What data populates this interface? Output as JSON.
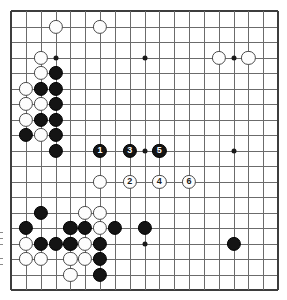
{
  "figure": {
    "kind": "go-game-diagram",
    "board_size": 19,
    "board_bounds": {
      "left": 11,
      "top": 11,
      "right": 278,
      "bottom": 290
    },
    "colors": {
      "black": "#141414",
      "white": "#fdfdfd",
      "line": "#6b6b6b",
      "edge": "#3d3d3d",
      "background": "#ffffff"
    }
  },
  "hoshi": [
    {
      "col": 3,
      "row": 3
    },
    {
      "col": 9,
      "row": 3
    },
    {
      "col": 15,
      "row": 3
    },
    {
      "col": 3,
      "row": 9
    },
    {
      "col": 9,
      "row": 9
    },
    {
      "col": 15,
      "row": 9
    },
    {
      "col": 3,
      "row": 15
    },
    {
      "col": 9,
      "row": 15
    },
    {
      "col": 15,
      "row": 15
    }
  ],
  "stones": [
    {
      "col": 3,
      "row": 1,
      "color": "white",
      "label": ""
    },
    {
      "col": 6,
      "row": 1,
      "color": "white",
      "label": ""
    },
    {
      "col": 14,
      "row": 3,
      "color": "white",
      "label": ""
    },
    {
      "col": 16,
      "row": 3,
      "color": "white",
      "label": ""
    },
    {
      "col": 2,
      "row": 3,
      "color": "white",
      "label": ""
    },
    {
      "col": 2,
      "row": 4,
      "color": "white",
      "label": ""
    },
    {
      "col": 3,
      "row": 4,
      "color": "black",
      "label": ""
    },
    {
      "col": 1,
      "row": 5,
      "color": "white",
      "label": ""
    },
    {
      "col": 2,
      "row": 5,
      "color": "black",
      "label": ""
    },
    {
      "col": 3,
      "row": 5,
      "color": "black",
      "label": ""
    },
    {
      "col": 1,
      "row": 6,
      "color": "white",
      "label": ""
    },
    {
      "col": 2,
      "row": 6,
      "color": "white",
      "label": ""
    },
    {
      "col": 3,
      "row": 6,
      "color": "black",
      "label": ""
    },
    {
      "col": 1,
      "row": 7,
      "color": "white",
      "label": ""
    },
    {
      "col": 2,
      "row": 7,
      "color": "black",
      "label": ""
    },
    {
      "col": 3,
      "row": 7,
      "color": "black",
      "label": ""
    },
    {
      "col": 1,
      "row": 8,
      "color": "black",
      "label": ""
    },
    {
      "col": 2,
      "row": 8,
      "color": "white",
      "label": ""
    },
    {
      "col": 3,
      "row": 8,
      "color": "black",
      "label": ""
    },
    {
      "col": 3,
      "row": 9,
      "color": "black",
      "label": ""
    },
    {
      "col": 6,
      "row": 9,
      "color": "black",
      "label": "1"
    },
    {
      "col": 8,
      "row": 9,
      "color": "black",
      "label": "3"
    },
    {
      "col": 10,
      "row": 9,
      "color": "black",
      "label": "5"
    },
    {
      "col": 6,
      "row": 11,
      "color": "white",
      "label": ""
    },
    {
      "col": 8,
      "row": 11,
      "color": "white",
      "label": "2"
    },
    {
      "col": 10,
      "row": 11,
      "color": "white",
      "label": "4"
    },
    {
      "col": 12,
      "row": 11,
      "color": "white",
      "label": "6"
    },
    {
      "col": 2,
      "row": 13,
      "color": "black",
      "label": ""
    },
    {
      "col": 5,
      "row": 13,
      "color": "white",
      "label": ""
    },
    {
      "col": 6,
      "row": 13,
      "color": "white",
      "label": ""
    },
    {
      "col": 1,
      "row": 14,
      "color": "black",
      "label": ""
    },
    {
      "col": 4,
      "row": 14,
      "color": "black",
      "label": ""
    },
    {
      "col": 5,
      "row": 14,
      "color": "black",
      "label": ""
    },
    {
      "col": 6,
      "row": 14,
      "color": "white",
      "label": ""
    },
    {
      "col": 7,
      "row": 14,
      "color": "black",
      "label": ""
    },
    {
      "col": 9,
      "row": 14,
      "color": "black",
      "label": ""
    },
    {
      "col": 1,
      "row": 15,
      "color": "white",
      "label": ""
    },
    {
      "col": 2,
      "row": 15,
      "color": "black",
      "label": ""
    },
    {
      "col": 3,
      "row": 15,
      "color": "black",
      "label": ""
    },
    {
      "col": 4,
      "row": 15,
      "color": "black",
      "label": ""
    },
    {
      "col": 5,
      "row": 15,
      "color": "white",
      "label": ""
    },
    {
      "col": 6,
      "row": 15,
      "color": "black",
      "label": ""
    },
    {
      "col": 15,
      "row": 15,
      "color": "black",
      "label": ""
    },
    {
      "col": 1,
      "row": 16,
      "color": "white",
      "label": ""
    },
    {
      "col": 2,
      "row": 16,
      "color": "white",
      "label": ""
    },
    {
      "col": 4,
      "row": 16,
      "color": "white",
      "label": ""
    },
    {
      "col": 5,
      "row": 16,
      "color": "white",
      "label": ""
    },
    {
      "col": 6,
      "row": 16,
      "color": "black",
      "label": ""
    },
    {
      "col": 4,
      "row": 17,
      "color": "white",
      "label": ""
    },
    {
      "col": 6,
      "row": 17,
      "color": "black",
      "label": ""
    }
  ],
  "move_labels": [
    "1",
    "2",
    "3",
    "4",
    "5",
    "6"
  ]
}
